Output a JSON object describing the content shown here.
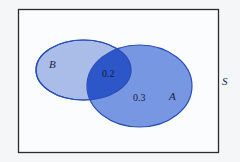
{
  "diagram": {
    "type": "venn",
    "universe": {
      "label": "S",
      "frame_color": "#2b2b2b",
      "background": "#fbfcfd"
    },
    "sets": [
      {
        "name": "B",
        "label": "B",
        "fill": "#a9bde8",
        "stroke": "#2a4fb5"
      },
      {
        "name": "A",
        "label": "A",
        "fill": "#6c8ee0",
        "stroke": "#2a4fb5"
      }
    ],
    "regions": {
      "intersection": {
        "value": "0.2",
        "fill": "#2d57c8"
      },
      "a_only": {
        "value": "0.3"
      }
    }
  }
}
